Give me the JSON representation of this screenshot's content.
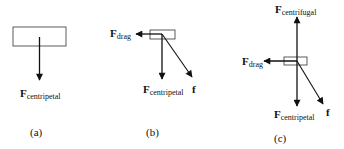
{
  "figure": {
    "panels": [
      {
        "id": "a",
        "caption": "(a)",
        "forces": [
          {
            "symbol": "F",
            "subscript": "centripetal",
            "direction": "down"
          }
        ]
      },
      {
        "id": "b",
        "caption": "(b)",
        "forces": [
          {
            "symbol": "F",
            "subscript": "drag",
            "direction": "left"
          },
          {
            "symbol": "F",
            "subscript": "centripetal",
            "direction": "down"
          },
          {
            "symbol": "f",
            "subscript": "",
            "direction": "down-right"
          }
        ]
      },
      {
        "id": "c",
        "caption": "(c)",
        "forces": [
          {
            "symbol": "F",
            "subscript": "centrifugal",
            "direction": "up"
          },
          {
            "symbol": "F",
            "subscript": "drag",
            "direction": "left"
          },
          {
            "symbol": "F",
            "subscript": "centripetal",
            "direction": "down"
          },
          {
            "symbol": "f",
            "subscript": "",
            "direction": "down-right"
          }
        ]
      }
    ],
    "colors": {
      "stroke": "#111111",
      "background": "#ffffff"
    }
  }
}
